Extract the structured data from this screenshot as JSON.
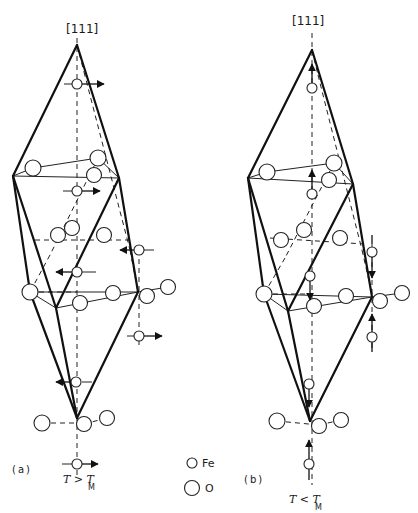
{
  "figure": {
    "axis_label": "[111]",
    "panels": [
      {
        "id": "a",
        "label": "(a)",
        "condition": {
          "text": "T > T",
          "subscript": "M"
        }
      },
      {
        "id": "b",
        "label": "(b)",
        "condition": {
          "text": "T < T",
          "subscript": "M"
        }
      }
    ],
    "legend": [
      {
        "symbol": "small-circle",
        "label": "Fe"
      },
      {
        "symbol": "large-circle",
        "label": "O"
      }
    ],
    "colors": {
      "line": "#111111",
      "background": "#ffffff"
    }
  }
}
